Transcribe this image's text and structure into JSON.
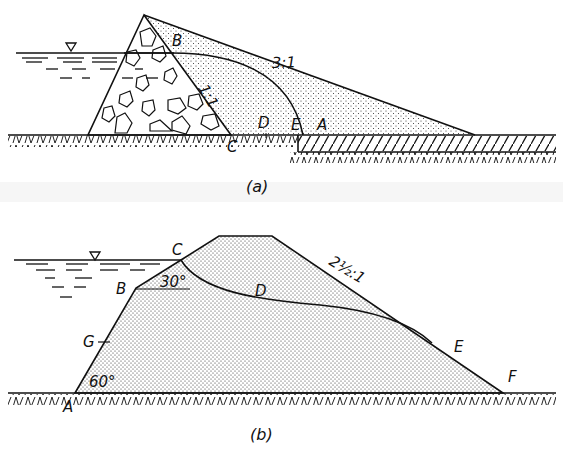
{
  "figure_a": {
    "caption": "(a)",
    "slope_label_rock": "1:1",
    "slope_label_earth": "3:1",
    "points": {
      "B": "B",
      "C": "C",
      "D": "D",
      "E": "E",
      "A": "A"
    },
    "description": "Earth dam with rockfill toe on upstream side, seepage line from B to A, drainage blanket downstream"
  },
  "figure_b": {
    "caption": "(b)",
    "slope_label": "2½:1",
    "angle_upper": "30°",
    "angle_lower": "60°",
    "points": {
      "A": "A",
      "G": "G",
      "B": "B",
      "C": "C",
      "D": "D",
      "E": "E",
      "F": "F"
    },
    "description": "Earth dam with broken upstream slope, seepage line C-D-E exiting on downstream face"
  },
  "symbols": {
    "water_level": "water-surface-triangle"
  },
  "colors": {
    "ink": "#111111",
    "paper": "#ffffff",
    "caption_band": "#f3f3f3"
  }
}
